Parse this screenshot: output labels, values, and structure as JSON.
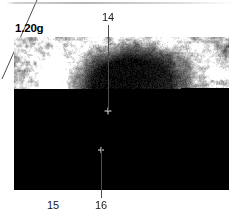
{
  "figure": {
    "type": "ultrasound-scan",
    "modality": "B-mode grayscale ultrasound",
    "weight_label": "1.20g",
    "callouts": [
      {
        "id": "14",
        "label": "14",
        "leader": "vertical-down",
        "position": "top-center"
      },
      {
        "id": "15",
        "label": "15",
        "leader": "diagonal-up-right",
        "position": "bottom-left"
      },
      {
        "id": "16",
        "label": "16",
        "leader": "vertical-up",
        "position": "bottom-center"
      }
    ],
    "colors": {
      "background": "#ffffff",
      "text": "#1a1a1a",
      "leader_line": "#4c4c4c",
      "scan_dark": "#000000",
      "scan_bright": "#ffffff"
    }
  }
}
